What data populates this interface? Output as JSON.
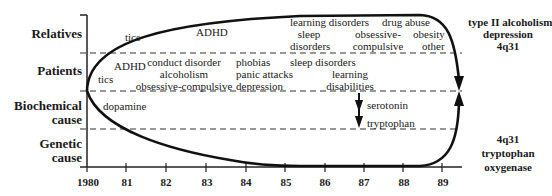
{
  "rows": {
    "relatives": "Relatives",
    "patients": "Patients",
    "biochemical": [
      "Biochemical",
      "cause"
    ],
    "genetic": [
      "Genetic",
      "cause"
    ]
  },
  "axis": {
    "ticks": [
      "1980",
      "81",
      "82",
      "83",
      "84",
      "85",
      "86",
      "87",
      "88",
      "89"
    ]
  },
  "relatives_items": {
    "tics": "tics",
    "adhd": "ADHD",
    "learning_disorders": "learning disorders",
    "sleep_disorders": [
      "sleep",
      "disorders"
    ],
    "drug_abuse": "drug abuse",
    "obsessive_compulsive": [
      "obsessive-",
      "compulsive"
    ],
    "obesity": "obesity",
    "other": "other"
  },
  "patients_items": {
    "tics": "tics",
    "adhd": "ADHD",
    "group82": [
      "conduct disorder",
      "alcoholism",
      "obsessive-compulsive"
    ],
    "group84": [
      "phobias",
      "panic attacks",
      "depression"
    ],
    "sleep_disorders": "sleep disorders",
    "learning_disabilities": [
      "learning",
      "disabilities"
    ]
  },
  "biochemical_items": {
    "dopamine": "dopamine",
    "serotonin": "serotonin",
    "tryptophan": "tryptophan"
  },
  "right_notes": {
    "top": [
      "type II alcoholism",
      "depression",
      "4q31"
    ],
    "bottom": [
      "4q31",
      "tryptophan",
      "oxygenase"
    ]
  }
}
